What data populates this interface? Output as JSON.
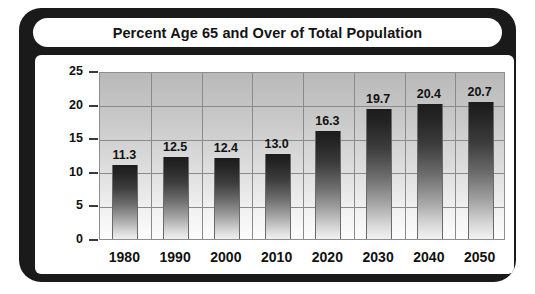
{
  "figure": {
    "title": "Percent Age 65 and Over of Total Population",
    "axis_title_y": "Percent",
    "frame_color": "#1a1a1a",
    "panel_color": "#ffffff"
  },
  "chart_data": {
    "type": "bar",
    "title": "Percent Age 65 and Over of Total Population",
    "xlabel": "",
    "ylabel": "Percent",
    "categories": [
      "1980",
      "1990",
      "2000",
      "2010",
      "2020",
      "2030",
      "2040",
      "2050"
    ],
    "values": [
      11.3,
      12.5,
      12.4,
      13.0,
      16.3,
      19.7,
      20.4,
      20.7
    ],
    "data_labels": [
      "11.3",
      "12.5",
      "12.4",
      "13.0",
      "16.3",
      "19.7",
      "20.4",
      "20.7"
    ],
    "ylim": [
      0,
      25
    ],
    "yticks": [
      0,
      5,
      10,
      15,
      20,
      25
    ],
    "ytick_labels": [
      "0",
      "5",
      "10",
      "15",
      "20",
      "25"
    ],
    "grid": true,
    "grid_axis": "both",
    "legend": null,
    "bar_fill": "gradient-black-to-white",
    "plot_background": "gradient-grey-to-white"
  }
}
